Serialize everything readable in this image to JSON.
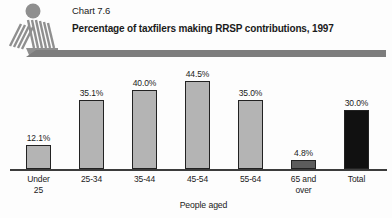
{
  "header": {
    "chart_label": "Chart 7.6",
    "title": "Percentage of taxfilers making RRSP contributions, 1997"
  },
  "chart_data": {
    "type": "bar",
    "title": "Percentage of taxfilers making RRSP contributions, 1997",
    "xlabel": "People aged",
    "ylabel": "",
    "ylim": [
      0,
      50
    ],
    "grid": false,
    "legend": "none",
    "categories": [
      "Under\n25",
      "25-34",
      "35-44",
      "45-54",
      "55-64",
      "65 and\nover",
      "Total"
    ],
    "values": [
      12.1,
      35.1,
      40.0,
      44.5,
      35.0,
      4.8,
      30.0
    ],
    "value_labels": [
      "12.1%",
      "35.1%",
      "40.0%",
      "44.5%",
      "35.0%",
      "4.8%",
      "30.0%"
    ],
    "bar_colors": [
      "#b4b4b4",
      "#b4b4b4",
      "#b4b4b4",
      "#b4b4b4",
      "#b4b4b4",
      "#5c5c5c",
      "#111111"
    ]
  },
  "icons": {
    "logo": "person-figure-logo"
  },
  "colors": {
    "bar_fill_default": "#b4b4b4",
    "bar_fill_65_over": "#5c5c5c",
    "bar_fill_total": "#111111",
    "bar_border": "#222222",
    "axis_line": "#3c3c3c",
    "divider_bar": "#7d7d7d",
    "logo_gray": "#8f8f8f",
    "text": "#1b1b1b",
    "background": "#fdfdfd"
  }
}
